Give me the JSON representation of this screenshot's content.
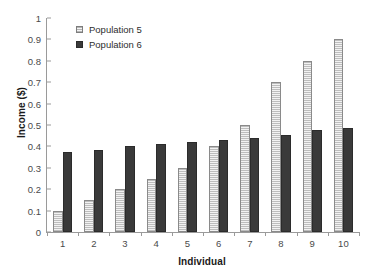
{
  "chart_data": {
    "type": "bar",
    "title": "",
    "xlabel": "Individual",
    "ylabel": "Income ($)",
    "categories": [
      "1",
      "2",
      "3",
      "4",
      "5",
      "6",
      "7",
      "8",
      "9",
      "10"
    ],
    "series": [
      {
        "name": "Population 5",
        "color": "#d4d4d4",
        "values": [
          0.1,
          0.15,
          0.2,
          0.25,
          0.3,
          0.4,
          0.5,
          0.7,
          0.8,
          0.9
        ]
      },
      {
        "name": "Population 6",
        "color": "#3a3a3a",
        "values": [
          0.375,
          0.385,
          0.4,
          0.41,
          0.42,
          0.43,
          0.44,
          0.455,
          0.475,
          0.485
        ]
      }
    ],
    "ylim": [
      0,
      1
    ],
    "yticks": [
      "0",
      "0.1",
      "0.2",
      "0.3",
      "0.4",
      "0.5",
      "0.6",
      "0.7",
      "0.8",
      "0.9",
      "1"
    ],
    "ytick_values": [
      0,
      0.1,
      0.2,
      0.3,
      0.4,
      0.5,
      0.6,
      0.7,
      0.8,
      0.9,
      1
    ],
    "grid": false,
    "legend_position": "top-left"
  }
}
